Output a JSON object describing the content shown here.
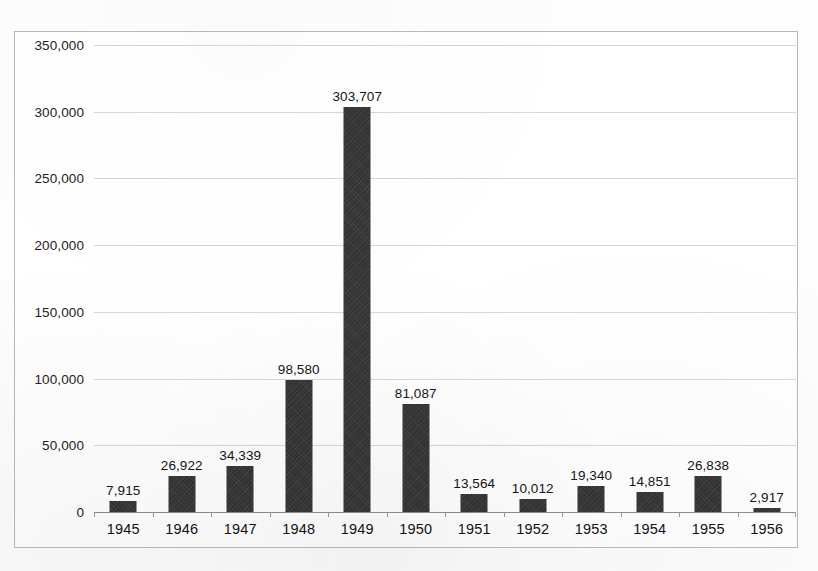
{
  "chart_data": {
    "type": "bar",
    "title": "",
    "subtitle": "",
    "xlabel": "",
    "ylabel": "",
    "categories": [
      "1945",
      "1946",
      "1947",
      "1948",
      "1949",
      "1950",
      "1951",
      "1952",
      "1953",
      "1954",
      "1955",
      "1956"
    ],
    "values": [
      7915,
      26922,
      34339,
      98580,
      303707,
      81087,
      13564,
      10012,
      19340,
      14851,
      26838,
      2917
    ],
    "value_labels": [
      "7,915",
      "26,922",
      "34,339",
      "98,580",
      "303,707",
      "81,087",
      "13,564",
      "10,012",
      "19,340",
      "14,851",
      "26,838",
      "2,917"
    ],
    "ylim": [
      0,
      350000
    ],
    "ytick_values": [
      0,
      50000,
      100000,
      150000,
      200000,
      250000,
      300000,
      350000
    ],
    "ytick_labels": [
      "0",
      "50,000",
      "100,000",
      "150,000",
      "200,000",
      "250,000",
      "300,000",
      "350,000"
    ],
    "grid": true,
    "legend": null,
    "legend_position": "none",
    "data_labels": true,
    "series": [
      {
        "name": "",
        "color": "#333333",
        "values": [
          7915,
          26922,
          34339,
          98580,
          303707,
          81087,
          13564,
          10012,
          19340,
          14851,
          26838,
          2917
        ]
      }
    ],
    "colors": {
      "bar": "#333333",
      "gridline": "#d7d7d7",
      "axis": "#8f8f8f",
      "frame": "#b9b9b9",
      "plot_background": "#ffffff",
      "text": "#151515"
    }
  }
}
